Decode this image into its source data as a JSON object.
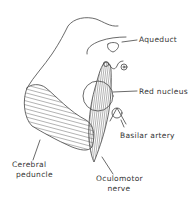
{
  "diagram": {
    "stroke_color": "#444444",
    "background": "#ffffff",
    "labels": {
      "aqueduct": "Aqueduct",
      "red_nucleus": "Red nucleus",
      "basilar_artery": "Basilar artery",
      "cerebral_peduncle_line1": "Cerebral",
      "cerebral_peduncle_line2": "peduncle",
      "oculomotor_nerve_line1": "Oculomotor",
      "oculomotor_nerve_line2": "nerve"
    }
  }
}
